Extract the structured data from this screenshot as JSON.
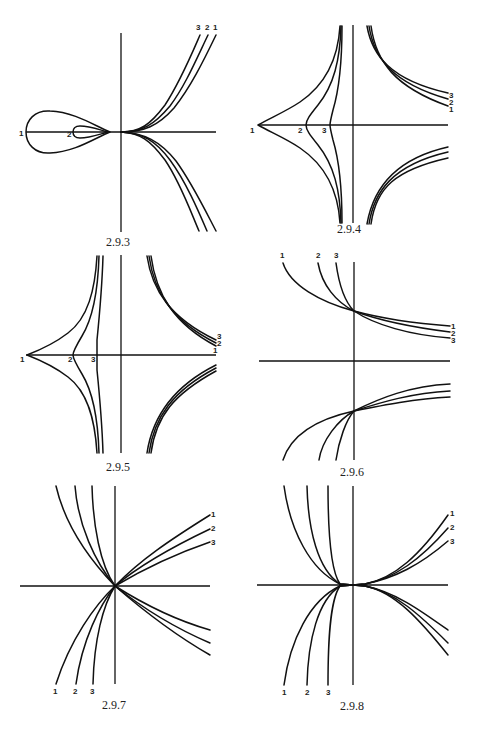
{
  "page": {
    "background": "#ffffff",
    "ink": "#111111",
    "width": 486,
    "height": 735
  },
  "figures": [
    {
      "id": "2.9.3",
      "caption": "2.9.3",
      "caption_pos": [
        122,
        245
      ],
      "origin": [
        121,
        132
      ],
      "axes": {
        "x": [
          26,
          216
        ],
        "y": [
          33,
          232
        ]
      },
      "curve_labels": [
        {
          "text": "3",
          "pos": [
            199,
            30
          ]
        },
        {
          "text": "2",
          "pos": [
            207,
            30
          ]
        },
        {
          "text": "1",
          "pos": [
            215,
            30
          ]
        },
        {
          "text": "1",
          "pos": [
            21,
            138
          ]
        },
        {
          "text": "2",
          "pos": [
            68,
            139
          ]
        }
      ]
    },
    {
      "id": "2.9.4",
      "caption": "2.9.4",
      "caption_pos": [
        352,
        232
      ],
      "origin": [
        353,
        125
      ],
      "axes": {
        "x": [
          258,
          448
        ],
        "y": [
          25,
          223
        ]
      },
      "curve_labels": [
        {
          "text": "3",
          "pos": [
            451,
            97
          ]
        },
        {
          "text": "2",
          "pos": [
            451,
            104
          ]
        },
        {
          "text": "1",
          "pos": [
            451,
            111
          ]
        },
        {
          "text": "1",
          "pos": [
            253,
            133
          ]
        },
        {
          "text": "2",
          "pos": [
            300,
            133
          ]
        },
        {
          "text": "3",
          "pos": [
            323,
            133
          ]
        }
      ]
    },
    {
      "id": "2.9.5",
      "caption": "2.9.5",
      "caption_pos": [
        122,
        470
      ],
      "origin": [
        121,
        355
      ],
      "axes": {
        "x": [
          26,
          216
        ],
        "y": [
          255,
          453
        ]
      },
      "curve_labels": [
        {
          "text": "3",
          "pos": [
            217,
            339
          ]
        },
        {
          "text": "2",
          "pos": [
            217,
            346
          ]
        },
        {
          "text": "1",
          "pos": [
            214,
            353
          ]
        },
        {
          "text": "1",
          "pos": [
            22,
            362
          ]
        },
        {
          "text": "2",
          "pos": [
            69,
            362
          ]
        },
        {
          "text": "3",
          "pos": [
            92,
            362
          ]
        }
      ]
    },
    {
      "id": "2.9.6",
      "caption": "2.9.6",
      "caption_pos": [
        355,
        475
      ],
      "origin": [
        354,
        361
      ],
      "axes": {
        "x": [
          259,
          450
        ],
        "y": [
          262,
          460
        ]
      },
      "curve_labels": [
        {
          "text": "1",
          "pos": [
            282,
            259
          ]
        },
        {
          "text": "2",
          "pos": [
            318,
            259
          ]
        },
        {
          "text": "3",
          "pos": [
            336,
            259
          ]
        },
        {
          "text": "1",
          "pos": [
            452,
            328
          ]
        },
        {
          "text": "2",
          "pos": [
            452,
            335
          ]
        },
        {
          "text": "3",
          "pos": [
            452,
            342
          ]
        }
      ]
    },
    {
      "id": "2.9.7",
      "caption": "2.9.7",
      "caption_pos": [
        117,
        708
      ],
      "origin": [
        115,
        586
      ],
      "axes": {
        "x": [
          20,
          210
        ],
        "y": [
          486,
          684
        ]
      },
      "curve_labels": [
        {
          "text": "1",
          "pos": [
            213,
            517
          ]
        },
        {
          "text": "2",
          "pos": [
            213,
            531
          ]
        },
        {
          "text": "3",
          "pos": [
            213,
            545
          ]
        },
        {
          "text": "1",
          "pos": [
            55,
            694
          ]
        },
        {
          "text": "2",
          "pos": [
            75,
            694
          ]
        },
        {
          "text": "3",
          "pos": [
            92,
            694
          ]
        }
      ]
    },
    {
      "id": "2.9.8",
      "caption": "2.9.8",
      "caption_pos": [
        355,
        709
      ],
      "origin": [
        353,
        585
      ],
      "axes": {
        "x": [
          257,
          448
        ],
        "y": [
          486,
          685
        ]
      },
      "curve_labels": [
        {
          "text": "1",
          "pos": [
            452,
            516
          ]
        },
        {
          "text": "2",
          "pos": [
            452,
            530
          ]
        },
        {
          "text": "3",
          "pos": [
            452,
            544
          ]
        },
        {
          "text": "1",
          "pos": [
            284,
            695
          ]
        },
        {
          "text": "2",
          "pos": [
            307,
            695
          ]
        },
        {
          "text": "3",
          "pos": [
            328,
            695
          ]
        }
      ]
    }
  ]
}
